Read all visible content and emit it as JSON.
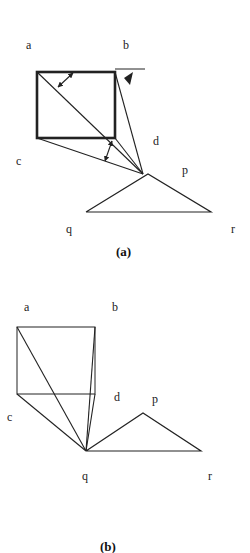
{
  "figure_a": {
    "caption": "(a)",
    "labels": {
      "a": "a",
      "b": "b",
      "c": "c",
      "d": "d",
      "p": "p",
      "q": "q",
      "r": "r"
    }
  },
  "figure_b": {
    "caption": "(b)",
    "labels": {
      "a": "a",
      "b": "b",
      "c": "c",
      "d": "d",
      "p": "p",
      "q": "q",
      "r": "r"
    }
  },
  "colors": {
    "line": "#222222",
    "background": "#ffffff"
  }
}
